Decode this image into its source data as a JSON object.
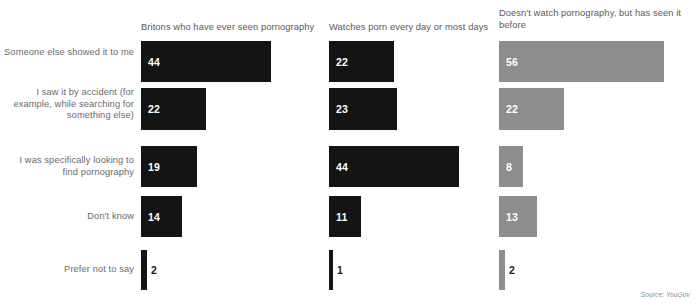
{
  "source_note": "Source: YouGov",
  "row_labels": [
    "Someone else showed it to me",
    "I saw it by accident (for example, while searching for something else)",
    "I was specifically looking to find pornography",
    "Don't know",
    "Prefer not to say"
  ],
  "columns": [
    {
      "header": "Britons who have ever seen pornography",
      "color": "#141414",
      "values": [
        44,
        22,
        19,
        14,
        2
      ]
    },
    {
      "header": "Watches porn every day or most days",
      "color": "#141414",
      "values": [
        22,
        23,
        44,
        11,
        1
      ]
    },
    {
      "header": "Doesn't watch pornography, but has seen it before",
      "color": "#8d8d8d",
      "values": [
        56,
        22,
        8,
        13,
        2
      ]
    }
  ],
  "chart_data": {
    "type": "bar",
    "orientation": "horizontal",
    "title": "",
    "subtitle": "",
    "xlabel": "",
    "ylabel": "",
    "grid": false,
    "legend_position": "none",
    "annotations": [
      "Source: YouGov"
    ],
    "value_unit": "%",
    "px_per_unit": 2.95,
    "categories": [
      "Someone else showed it to me",
      "I saw it by accident (for example, while searching for something else)",
      "I was specifically looking to find pornography",
      "Don't know",
      "Prefer not to say"
    ],
    "series": [
      {
        "name": "Britons who have ever seen pornography",
        "color": "#141414",
        "values": [
          44,
          22,
          19,
          14,
          2
        ]
      },
      {
        "name": "Watches porn every day or most days",
        "color": "#141414",
        "values": [
          22,
          23,
          44,
          11,
          1
        ]
      },
      {
        "name": "Doesn't watch pornography, but has seen it before",
        "color": "#8d8d8d",
        "values": [
          56,
          22,
          8,
          13,
          2
        ]
      }
    ],
    "xlim": [
      0,
      56
    ],
    "tick_labels": []
  },
  "layout": {
    "column_x": [
      141,
      329,
      499
    ],
    "row_y": [
      41,
      88,
      146,
      196,
      250
    ],
    "row_h": [
      41,
      42,
      41,
      41,
      40
    ],
    "label_y": [
      50,
      86,
      152,
      210,
      263
    ]
  }
}
